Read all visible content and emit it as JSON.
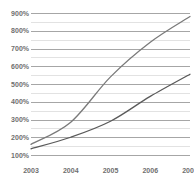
{
  "chart_data": {
    "type": "line",
    "title": "",
    "top_caption": "",
    "xlabel": "",
    "ylabel": "",
    "x": [
      2003,
      2004,
      2005,
      2006,
      2007
    ],
    "categories": [
      "2003",
      "2004",
      "2005",
      "2006",
      "2007"
    ],
    "xtick_labels": [
      "2003",
      "2004",
      "2005",
      "2006",
      "2007"
    ],
    "ytick_labels": [
      "100%",
      "200%",
      "300%",
      "400%",
      "500%",
      "600%",
      "700%",
      "800%",
      "900%"
    ],
    "ytick_values": [
      100,
      200,
      300,
      400,
      500,
      600,
      700,
      800,
      900
    ],
    "ylim": [
      100,
      900
    ],
    "xlim": [
      2003,
      2007
    ],
    "grid": "horizontal-major-and-minor",
    "minor_gridline_step": 50,
    "major_gridline_step": 100,
    "legend": "none",
    "series": [
      {
        "name": "upper-series",
        "color": "#7a7a7a",
        "values": [
          160,
          285,
          540,
          735,
          880
        ]
      },
      {
        "name": "lower-series",
        "color": "#5a5a5a",
        "values": [
          135,
          200,
          290,
          430,
          555
        ]
      }
    ]
  },
  "colors": {
    "major_gridline": "#a6a6a6",
    "minor_gridline": "#e2e2e2",
    "text": "#6f6f6f",
    "background": "#ffffff"
  }
}
